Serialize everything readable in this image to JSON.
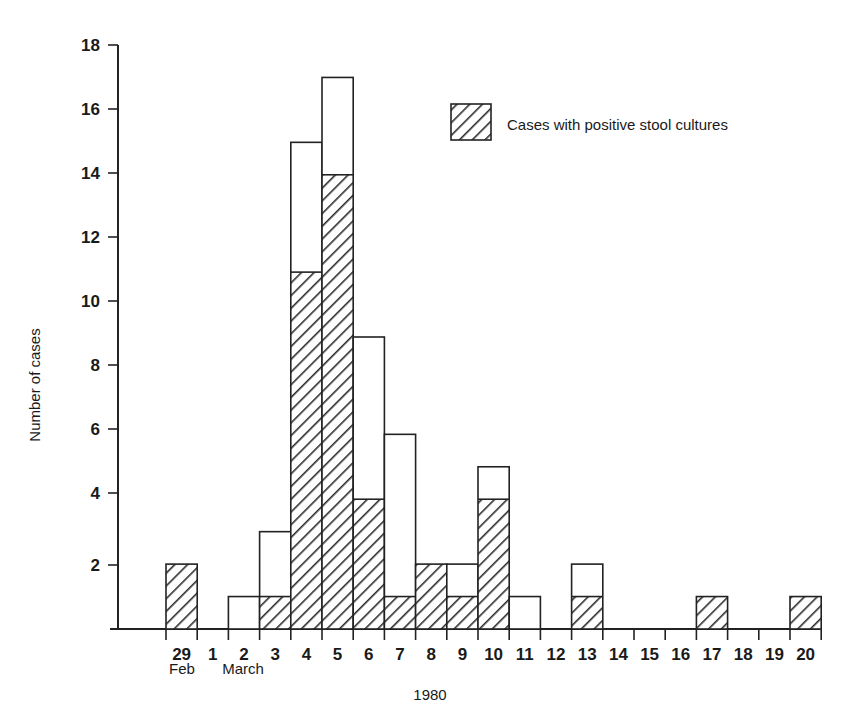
{
  "chart_data": {
    "type": "bar",
    "title": "",
    "subtitle": "",
    "xlabel": "1980",
    "ylabel": "Number of cases",
    "ylim": [
      0,
      18
    ],
    "ytick_step": 2,
    "yticks": [
      0,
      2,
      4,
      6,
      8,
      10,
      12,
      14,
      16,
      18
    ],
    "ytick_labels": [
      "",
      "2",
      "4",
      "6",
      "8",
      "10",
      "12",
      "14",
      "16",
      "18"
    ],
    "grid": false,
    "stacked": true,
    "legend_position": "upper-right",
    "categories": [
      "29",
      "1",
      "2",
      "3",
      "4",
      "5",
      "6",
      "7",
      "8",
      "9",
      "10",
      "11",
      "12",
      "13",
      "14",
      "15",
      "16",
      "17",
      "18",
      "19",
      "20"
    ],
    "month_groups": [
      {
        "label": "Feb",
        "categories": [
          "29"
        ]
      },
      {
        "label": "March",
        "categories": [
          "1",
          "2",
          "3",
          "4",
          "5",
          "6",
          "7",
          "8",
          "9",
          "10",
          "11",
          "12",
          "13",
          "14",
          "15",
          "16",
          "17",
          "18",
          "19",
          "20"
        ]
      }
    ],
    "series": [
      {
        "name": "Cases with positive stool cultures",
        "fill": "hatch",
        "values": [
          2,
          0,
          0,
          1,
          11,
          14,
          4,
          1,
          2,
          1,
          4,
          0,
          0,
          1,
          0,
          0,
          0,
          1,
          0,
          0,
          1
        ]
      },
      {
        "name": "Total cases",
        "fill": "none",
        "values": [
          2,
          0,
          1,
          3,
          15,
          17,
          9,
          6,
          2,
          2,
          5,
          1,
          0,
          2,
          0,
          0,
          0,
          1,
          0,
          0,
          1
        ]
      }
    ],
    "annotations": []
  },
  "axis": {
    "y_title": "Number of cases",
    "x_title": "1980",
    "month_feb": "Feb",
    "month_march": "March"
  },
  "legend": {
    "entries": [
      {
        "label": "Cases with positive stool cultures",
        "swatch": "hatched-square"
      }
    ]
  },
  "caption": {
    "text": ""
  }
}
